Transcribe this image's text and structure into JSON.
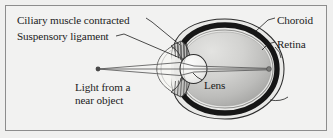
{
  "figure": {
    "frame": {
      "border_color": "#8d8d8d",
      "background": "#f2f2f1"
    }
  },
  "labels": {
    "ciliary_muscle": "Ciliary muscle contracted",
    "suspensory_ligament": "Suspensory ligament",
    "choroid": "Choroid",
    "retina": "Retina",
    "lens": "Lens",
    "light_line1": "Light from a",
    "light_line2": "near object"
  },
  "diagram": {
    "kind": "eye-cross-section",
    "parts": [
      "sclera",
      "choroid",
      "retina",
      "vitreous-humour",
      "lens",
      "ciliary-muscle",
      "suspensory-ligament",
      "cornea",
      "aqueous-humour",
      "light-rays",
      "object-point",
      "image-point"
    ],
    "colors": {
      "outline": "#2a2a2a",
      "choroid_dark": "#171717",
      "sclera_fill": "#e8e8e6",
      "vitreous_light": "#dcdcda",
      "vitreous_mid": "#c2c2c0",
      "vitreous_dark": "#a6a6a4",
      "lens_fill": "#f4f4f2",
      "ray_line": "#585858"
    }
  }
}
